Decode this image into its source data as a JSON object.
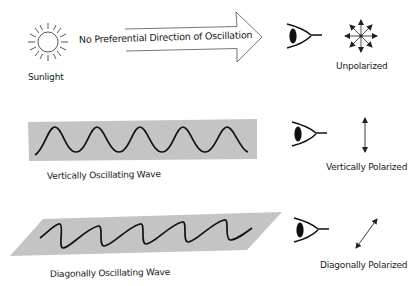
{
  "diagram": {
    "rows": [
      {
        "source_label": "Sunlight",
        "arrow_label": "No Preferential Direction of Oscillation",
        "result_label": "Unpolarized",
        "source_icon": "sun-icon",
        "observer_icon": "eye-icon",
        "result_icon": "multi-direction-arrows-icon"
      },
      {
        "source_label": "Vertically Oscillating Wave",
        "result_label": "Vertically Polarized",
        "source_icon": "vertical-wave-icon",
        "observer_icon": "eye-icon",
        "result_icon": "vertical-double-arrow-icon"
      },
      {
        "source_label": "Diagonally Oscillating Wave",
        "result_label": "Diagonally Polarized",
        "source_icon": "diagonal-wave-icon",
        "observer_icon": "eye-icon",
        "result_icon": "diagonal-double-arrow-icon"
      }
    ],
    "colors": {
      "wave_band": "#c4c4c4",
      "stroke": "#111111",
      "outline": "#555555"
    }
  }
}
